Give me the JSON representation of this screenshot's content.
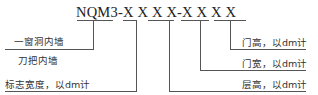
{
  "code": "NQM3-X X X X-X X X X",
  "labels": {
    "window_wall": "一窗洞内墙",
    "knife_wall": "刀把内墙",
    "mark_width": "标志宽度，以dm计",
    "door_height": "门高，以dm计",
    "door_width": "门宽，以dm计",
    "floor_height": "层高，以dm计"
  }
}
